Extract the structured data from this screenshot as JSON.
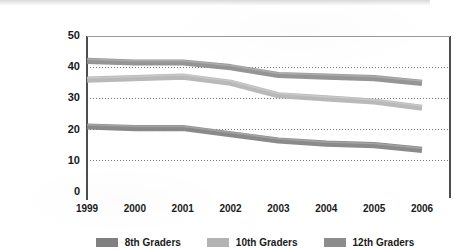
{
  "chart_data": {
    "type": "line",
    "title": "",
    "subtitle": "",
    "xlabel": "",
    "ylabel": "",
    "categories": [
      "1999",
      "2000",
      "2001",
      "2002",
      "2003",
      "2004",
      "2005",
      "2006"
    ],
    "x": [
      1999,
      2000,
      2001,
      2002,
      2003,
      2004,
      2005,
      2006
    ],
    "xlim": [
      1999,
      2006
    ],
    "ylim": [
      0,
      50
    ],
    "y_ticks": [
      0,
      10,
      20,
      30,
      40,
      50
    ],
    "x_ticks": [
      "1999",
      "2000",
      "2001",
      "2002",
      "2003",
      "2004",
      "2005",
      "2006"
    ],
    "grid": "horizontal-dotted",
    "gridlines_at": [
      10,
      20,
      30,
      40
    ],
    "legend_position": "bottom-center",
    "series": [
      {
        "name": "8th Graders",
        "color": "#808080",
        "values": [
          21,
          20.5,
          20.5,
          18.5,
          16.5,
          15.5,
          15,
          13.5
        ]
      },
      {
        "name": "10th Graders",
        "color": "#b3b3b3",
        "values": [
          36,
          36.5,
          37,
          35,
          31,
          30,
          29,
          27
        ]
      },
      {
        "name": "12th Graders",
        "color": "#8c8c8c",
        "values": [
          42,
          41.5,
          41.5,
          40,
          37.5,
          37,
          36.5,
          35
        ]
      }
    ]
  },
  "legend": {
    "items": [
      {
        "label": "8th Graders",
        "color": "#808080"
      },
      {
        "label": "10th Graders",
        "color": "#b3b3b3"
      },
      {
        "label": "12th Graders",
        "color": "#8c8c8c"
      }
    ]
  },
  "axes": {
    "y_labels": [
      "50",
      "40",
      "30",
      "20",
      "10",
      "0"
    ],
    "x_labels": [
      "1999",
      "2000",
      "2001",
      "2002",
      "2003",
      "2004",
      "2005",
      "2006"
    ]
  },
  "colors": {
    "axis_line": "#4d4d4d",
    "gridline": "#777777",
    "text": "#1a1a1a",
    "background": "#ffffff"
  }
}
